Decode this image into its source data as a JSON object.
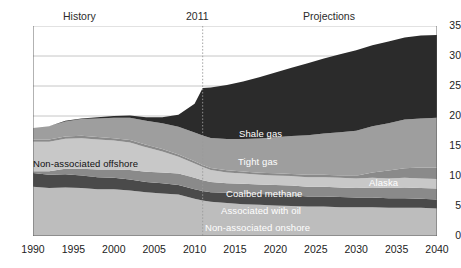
{
  "header": {
    "history_label": "History",
    "divider_year": "2011",
    "projections_label": "Projections"
  },
  "chart_data": {
    "type": "area",
    "title": "",
    "subtitle": "",
    "xlabel": "",
    "ylabel": "",
    "grid": true,
    "legend_position": "inline-annotations",
    "xlim": [
      1990,
      2040
    ],
    "ylim": [
      0,
      35
    ],
    "yticks": [
      0,
      5,
      10,
      15,
      20,
      25,
      30,
      35
    ],
    "xticks": [
      1990,
      1995,
      2000,
      2005,
      2010,
      2015,
      2020,
      2025,
      2030,
      2035,
      2040
    ],
    "divider_x": 2011,
    "stacked": true,
    "x": [
      1990,
      1992,
      1994,
      1996,
      1998,
      2000,
      2002,
      2004,
      2006,
      2008,
      2010,
      2011,
      2012,
      2014,
      2016,
      2018,
      2020,
      2022,
      2024,
      2026,
      2028,
      2030,
      2032,
      2034,
      2036,
      2038,
      2040
    ],
    "series": [
      {
        "name": "Non-associated onshore",
        "color": "#bdbdbd",
        "values": [
          8.2,
          8.0,
          8.1,
          8.0,
          7.8,
          7.8,
          7.6,
          7.3,
          7.1,
          6.9,
          6.2,
          5.9,
          5.7,
          5.5,
          5.3,
          5.2,
          5.1,
          5.0,
          4.9,
          4.9,
          4.8,
          4.8,
          4.8,
          4.7,
          4.7,
          4.7,
          4.6
        ]
      },
      {
        "name": "Associated with oil",
        "color": "#4a4a4a",
        "values": [
          2.3,
          2.2,
          2.2,
          2.1,
          2.0,
          1.9,
          1.8,
          1.7,
          1.7,
          1.6,
          1.6,
          1.6,
          1.6,
          1.7,
          1.8,
          1.8,
          1.8,
          1.8,
          1.7,
          1.7,
          1.7,
          1.6,
          1.6,
          1.6,
          1.6,
          1.5,
          1.5
        ]
      },
      {
        "name": "Coalbed methane",
        "color": "#8a8a8a",
        "values": [
          0.3,
          0.6,
          0.9,
          1.1,
          1.3,
          1.4,
          1.6,
          1.7,
          1.8,
          1.9,
          1.9,
          1.8,
          1.7,
          1.6,
          1.6,
          1.6,
          1.6,
          1.6,
          1.6,
          1.6,
          1.6,
          1.6,
          1.7,
          1.7,
          1.8,
          1.8,
          1.8
        ]
      },
      {
        "name": "Non-associated offshore",
        "color": "#c8c8c8",
        "values": [
          4.9,
          4.9,
          5.0,
          5.1,
          5.0,
          4.8,
          4.6,
          4.1,
          3.5,
          2.8,
          2.4,
          2.2,
          2.0,
          1.8,
          1.7,
          1.6,
          1.6,
          1.6,
          1.6,
          1.6,
          1.6,
          1.6,
          1.6,
          1.6,
          1.6,
          1.6,
          1.6
        ]
      },
      {
        "name": "Alaska",
        "color": "#8a8a8a",
        "values": [
          0.4,
          0.4,
          0.4,
          0.4,
          0.4,
          0.4,
          0.4,
          0.4,
          0.4,
          0.4,
          0.35,
          0.35,
          0.35,
          0.35,
          0.35,
          0.35,
          0.35,
          0.35,
          0.4,
          0.4,
          0.4,
          0.45,
          0.9,
          1.3,
          1.6,
          1.8,
          1.9
        ]
      },
      {
        "name": "Tight gas",
        "color": "#9e9e9e",
        "values": [
          1.9,
          2.2,
          2.5,
          2.8,
          3.1,
          3.4,
          3.7,
          4.0,
          4.3,
          4.6,
          4.8,
          4.9,
          5.0,
          5.2,
          5.4,
          5.7,
          6.0,
          6.3,
          6.6,
          6.9,
          7.2,
          7.5,
          7.7,
          7.9,
          8.1,
          8.2,
          8.3
        ]
      },
      {
        "name": "Shale gas",
        "color": "#2b2b2b",
        "values": [
          0.0,
          0.0,
          0.1,
          0.1,
          0.2,
          0.3,
          0.4,
          0.6,
          1.0,
          2.0,
          4.8,
          7.9,
          8.4,
          9.0,
          9.6,
          10.2,
          10.8,
          11.4,
          12.0,
          12.5,
          13.0,
          13.4,
          13.5,
          13.6,
          13.7,
          13.8,
          13.8
        ]
      }
    ],
    "annotations": [
      {
        "text": "Shale gas",
        "x_px": 239,
        "y_px": 128,
        "style": "light"
      },
      {
        "text": "Tight gas",
        "x_px": 238,
        "y_px": 156,
        "style": "light"
      },
      {
        "text": "Coalbed methane",
        "x_px": 226,
        "y_px": 188,
        "style": "light"
      },
      {
        "text": "Associated with oil",
        "x_px": 221,
        "y_px": 205,
        "style": "light"
      },
      {
        "text": "Non-associated onshore",
        "x_px": 205,
        "y_px": 222,
        "style": "light"
      },
      {
        "text": "Non-associated offshore",
        "x_px": 33,
        "y_px": 158,
        "style": "dark"
      },
      {
        "text": "Alaska",
        "x_px": 369,
        "y_px": 177,
        "style": "light"
      }
    ]
  }
}
